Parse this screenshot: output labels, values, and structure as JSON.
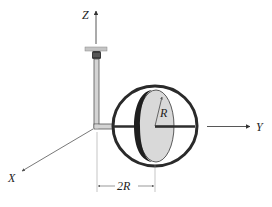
{
  "diagram": {
    "type": "engineering-mechanics-figure",
    "axes": {
      "z_label": "Z",
      "y_label": "Y",
      "x_label": "X"
    },
    "annotations": {
      "radius_label": "R",
      "dimension_label": "2R"
    },
    "colors": {
      "line": "#333333",
      "disk_fill": "#d9d9d9",
      "ring": "#2a2a2a",
      "rod_fill": "#cfcfcf",
      "mount_fill": "#bdbdbd"
    }
  }
}
